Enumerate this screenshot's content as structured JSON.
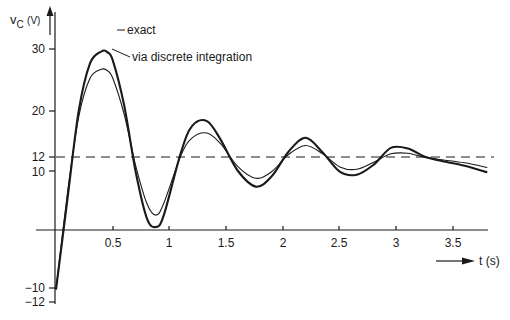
{
  "chart_data": {
    "type": "line",
    "title": "",
    "xlabel": "t (s)",
    "ylabel": "vC (V)",
    "ylabel_main": "v",
    "ylabel_sub": "C",
    "ylabel_unit": "(V)",
    "xlim": [
      0,
      3.8
    ],
    "ylim": [
      -12,
      32
    ],
    "grid": false,
    "x_ticks": [
      "0.5",
      "1",
      "1.5",
      "2",
      "2.5",
      "3",
      "3.5"
    ],
    "y_ticks": [
      "30",
      "20",
      "12",
      "10",
      "-10",
      "-12"
    ],
    "y_tick_labels": [
      "30",
      "20",
      "12",
      "10",
      "−10",
      "−12"
    ],
    "reference_line": {
      "value": 12,
      "style": "dashed"
    },
    "series": [
      {
        "name": "exact",
        "x": [
          0,
          0.1,
          0.2,
          0.3,
          0.4,
          0.45,
          0.5,
          0.6,
          0.7,
          0.8,
          0.88,
          0.95,
          1.1,
          1.2,
          1.33,
          1.45,
          1.6,
          1.76,
          1.9,
          2.05,
          2.2,
          2.35,
          2.5,
          2.65,
          2.8,
          2.95,
          3.1,
          3.25,
          3.4,
          3.6,
          3.8
        ],
        "values": [
          -10,
          5,
          20,
          28,
          30,
          29.9,
          28.5,
          21,
          10,
          2,
          0.5,
          2.5,
          13,
          17.5,
          18.3,
          15.2,
          10,
          7.3,
          9,
          13.2,
          15.5,
          13,
          9.8,
          9.3,
          11,
          13.8,
          13.7,
          12.3,
          11.6,
          10.8,
          9.7
        ]
      },
      {
        "name": "via discrete integration",
        "x": [
          0,
          0.1,
          0.2,
          0.3,
          0.4,
          0.45,
          0.5,
          0.6,
          0.7,
          0.8,
          0.88,
          0.95,
          1.1,
          1.2,
          1.33,
          1.45,
          1.6,
          1.76,
          1.9,
          2.05,
          2.2,
          2.35,
          2.5,
          2.65,
          2.8,
          2.95,
          3.1,
          3.25,
          3.4,
          3.6,
          3.8
        ],
        "values": [
          -10,
          6,
          19,
          25.5,
          27,
          26.8,
          25.5,
          19.5,
          11,
          4.5,
          2.5,
          4.5,
          12.5,
          15.5,
          16.3,
          14.5,
          10.7,
          8.7,
          9.8,
          12.7,
          14.2,
          12.8,
          10.6,
          10.2,
          11.4,
          12.8,
          12.9,
          12.2,
          11.8,
          11.3,
          10.5
        ]
      }
    ],
    "annotations": [
      "exact",
      "via discrete integration"
    ]
  },
  "labels": {
    "y_axis_main": "v",
    "y_axis_sub": "C",
    "y_axis_unit": "(V)",
    "x_axis": "t (s)",
    "legend_exact": "exact",
    "legend_discrete": "via discrete integration"
  }
}
